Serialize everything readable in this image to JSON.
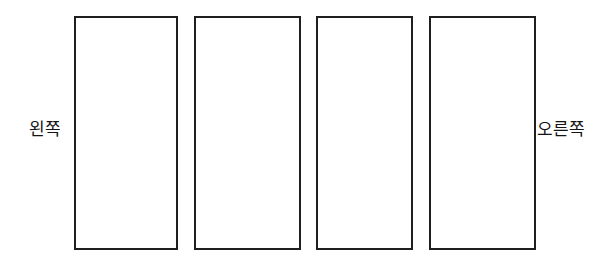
{
  "diagram": {
    "background_color": "#ffffff",
    "stroke_color": "#1f1f1f",
    "fill_color": "#ffffff",
    "panels": [
      {
        "id": "panel-1",
        "label": ""
      },
      {
        "id": "panel-2",
        "label": ""
      },
      {
        "id": "panel-3",
        "label": ""
      },
      {
        "id": "panel-4",
        "label": ""
      }
    ],
    "labels": {
      "left": "왼쪽",
      "right": "오른쪽"
    }
  }
}
